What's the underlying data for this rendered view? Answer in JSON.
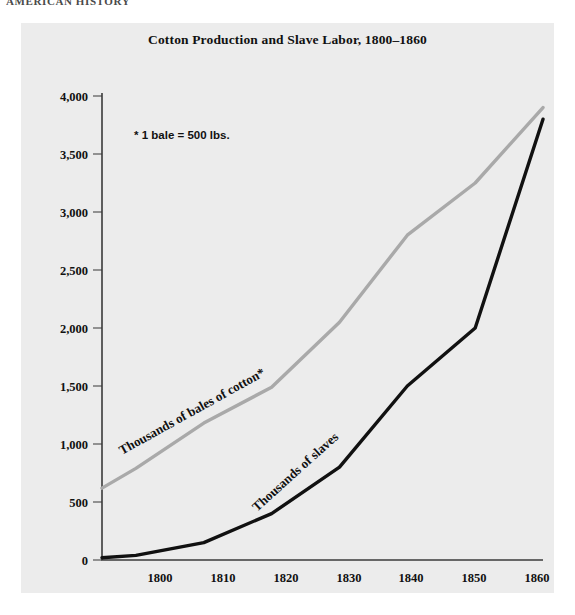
{
  "running_head": "AMERICAN HISTORY",
  "figure": {
    "title": "Cotton Production and Slave Labor, 1800–1860",
    "footnote": "* 1 bale = 500 lbs.",
    "panel_bg": "#ececec",
    "cotton_color": "#a9a9a9",
    "slaves_color": "#111111"
  },
  "chart_data": {
    "type": "line",
    "title": "Cotton Production and Slave Labor, 1800–1860",
    "xlabel": "",
    "ylabel": "",
    "grid": false,
    "legend": "inline-labels",
    "annotations": [
      "* 1 bale = 500 lbs."
    ],
    "xlim": [
      1795,
      1860
    ],
    "ylim": [
      0,
      4000
    ],
    "xticks": [
      "1800",
      "1810",
      "1820",
      "1830",
      "1840",
      "1850",
      "1860"
    ],
    "yticks": [
      "0",
      "500",
      "1,000",
      "1,500",
      "2,000",
      "2,500",
      "3,000",
      "3,500",
      "4,000"
    ],
    "x": [
      1795,
      1800,
      1810,
      1820,
      1830,
      1840,
      1850,
      1860
    ],
    "series": [
      {
        "name": "Thousands of bales of cotton*",
        "color": "#a9a9a9",
        "values": [
          620,
          790,
          1180,
          1490,
          2050,
          2800,
          3250,
          3900
        ]
      },
      {
        "name": "Thousands of slaves",
        "color": "#111111",
        "values": [
          20,
          40,
          150,
          400,
          800,
          1500,
          2000,
          3800
        ]
      }
    ]
  },
  "axis": {
    "y_tick_labels": [
      {
        "value": "4,000",
        "y": 73
      },
      {
        "value": "3,500",
        "y": 131
      },
      {
        "value": "3,000",
        "y": 189
      },
      {
        "value": "2,500",
        "y": 247
      },
      {
        "value": "2,000",
        "y": 305
      },
      {
        "value": "1,500",
        "y": 363
      },
      {
        "value": "1,000",
        "y": 421
      },
      {
        "value": "500",
        "y": 479
      },
      {
        "value": "0",
        "y": 537
      }
    ],
    "x_tick_labels": [
      {
        "value": "1800",
        "x": 160
      },
      {
        "value": "1810",
        "x": 222
      },
      {
        "value": "1820",
        "x": 285
      },
      {
        "value": "1830",
        "x": 348
      },
      {
        "value": "1840",
        "x": 411
      },
      {
        "value": "1850",
        "x": 474
      },
      {
        "value": "1860",
        "x": 537
      }
    ]
  },
  "series_labels": {
    "cotton": "Thousands of bales of cotton*",
    "slaves": "Thousands of slaves"
  }
}
